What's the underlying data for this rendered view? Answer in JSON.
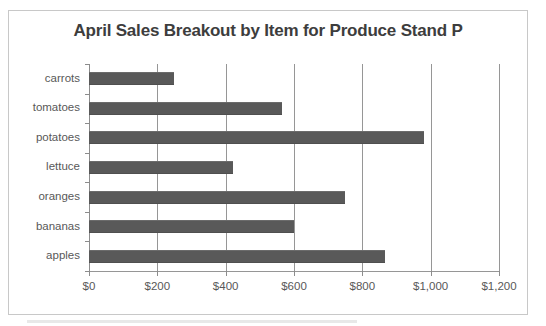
{
  "chart_data": {
    "type": "bar",
    "orientation": "horizontal",
    "title": "April Sales Breakout by Item for Produce Stand P",
    "xlabel": "",
    "ylabel": "",
    "categories": [
      "carrots",
      "tomatoes",
      "potatoes",
      "lettuce",
      "oranges",
      "bananas",
      "apples"
    ],
    "values": [
      250,
      565,
      980,
      420,
      750,
      600,
      865
    ],
    "xlim": [
      0,
      1200
    ],
    "xticks": [
      0,
      200,
      400,
      600,
      800,
      1000,
      1200
    ],
    "xtick_labels": [
      "$0",
      "$200",
      "$400",
      "$600",
      "$800",
      "$1,000",
      "$1,200"
    ],
    "grid": "vertical",
    "legend": "none",
    "series": [
      {
        "name": "April Sales",
        "color": "#595959",
        "values": [
          250,
          565,
          980,
          420,
          750,
          600,
          865
        ]
      }
    ]
  },
  "style": {
    "bar_color": "#595959",
    "gridline_color": "#969696",
    "axis_color": "#8c8c8c",
    "title_color": "#3d3d3d",
    "label_color": "#585858",
    "frame_border_color": "#c8c8c8",
    "background": "#ffffff"
  }
}
